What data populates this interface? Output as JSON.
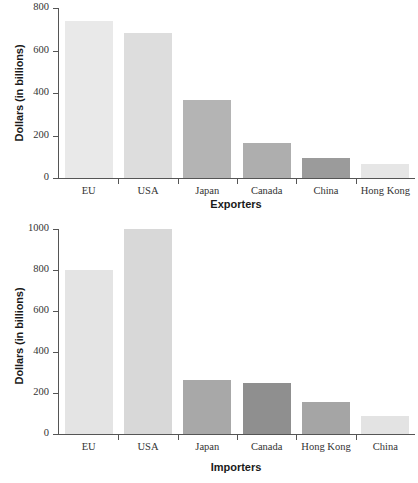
{
  "chart_data": [
    {
      "id": "exporters",
      "type": "bar",
      "title": "",
      "xlabel": "Exporters",
      "ylabel": "Dollars (in billions)",
      "categories": [
        "EU",
        "USA",
        "Japan",
        "Canada",
        "China",
        "Hong Kong"
      ],
      "values": [
        740,
        683,
        368,
        163,
        93,
        68
      ],
      "bar_colors": [
        "#e9e9e9",
        "#dddddd",
        "#b4b4b4",
        "#aeaeae",
        "#9b9b9b",
        "#e6e6e6"
      ],
      "ylim": [
        0,
        800
      ],
      "yticks": [
        0,
        200,
        400,
        600,
        800
      ],
      "ytick_labels": [
        "0",
        "200",
        "400",
        "600",
        "800"
      ],
      "grid": false,
      "legend": "none"
    },
    {
      "id": "importers",
      "type": "bar",
      "title": "",
      "xlabel": "Importers",
      "ylabel": "Dollars (in billions)",
      "categories": [
        "EU",
        "USA",
        "Japan",
        "Canada",
        "Hong Kong",
        "China"
      ],
      "values": [
        800,
        1000,
        263,
        250,
        155,
        90
      ],
      "bar_colors": [
        "#e4e4e4",
        "#d8d8d8",
        "#a8a8a8",
        "#8f8f8f",
        "#a5a5a5",
        "#e3e3e3"
      ],
      "ylim": [
        0,
        1000
      ],
      "yticks": [
        0,
        200,
        400,
        600,
        800,
        1000
      ],
      "ytick_labels": [
        "0",
        "200",
        "400",
        "600",
        "800",
        "1000"
      ],
      "grid": false,
      "legend": "none"
    }
  ],
  "axis_color": "#555555",
  "text_color": "#333333"
}
